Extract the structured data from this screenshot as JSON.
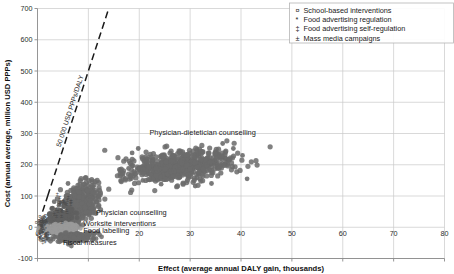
{
  "chart_data": {
    "type": "scatter",
    "title": "",
    "xlabel": "Effect (average annual DALY gain, thousands)",
    "ylabel": "Cost (annual average, million USD PPPs)",
    "xlim": [
      0,
      80
    ],
    "ylim": [
      -100,
      700
    ],
    "xticks": [
      0,
      10,
      20,
      30,
      40,
      50,
      60,
      70,
      80
    ],
    "yticks": [
      -100,
      0,
      100,
      200,
      300,
      400,
      500,
      600,
      700
    ],
    "xtick_labels": [
      "0",
      "10",
      "20",
      "30",
      "40",
      "50",
      "60",
      "70",
      "80"
    ],
    "ytick_labels": [
      "-100",
      "0",
      "100",
      "200",
      "300",
      "400",
      "500",
      "600",
      "700"
    ],
    "grid": true,
    "grid_color": "#c9c9c9",
    "marker_color": "#6b6b6b",
    "legend_position": "top-right",
    "threshold_line": {
      "label": "50 000 USD PPPs/DALY",
      "slope_usd_per_daly": 50000,
      "style": "dashed",
      "color": "#1a1a1a",
      "x_start": 2.0,
      "y_start": 100,
      "x_end": 14.0,
      "y_end": 700
    },
    "legend": [
      {
        "symbol": "¤",
        "label": "School-based interventions"
      },
      {
        "symbol": "*",
        "label": "Food advertising regulation"
      },
      {
        "symbol": "‡",
        "label": "Food advertising self-regulation"
      },
      {
        "symbol": "±",
        "label": "Mass media campaigns"
      }
    ],
    "annotations": [
      {
        "text": "Physician-dietetician counselling",
        "x": 22.0,
        "y": 295
      },
      {
        "text": "Physician counselling",
        "x": 11.5,
        "y": 40
      },
      {
        "text": "Worksite interventions",
        "x": 9.0,
        "y": 5
      },
      {
        "text": "Food labelling",
        "x": 9.0,
        "y": -18
      },
      {
        "text": "Fiscal measures",
        "x": 5.0,
        "y": -58
      }
    ],
    "clusters": [
      {
        "name": "Physician-dietetician counselling",
        "center_x": 28.0,
        "center_y": 195,
        "spread_x": 5.0,
        "spread_y": 30,
        "n": 620,
        "marker": "circle",
        "color": "#6b6b6b",
        "size": 2.6
      },
      {
        "name": "Physician counselling",
        "center_x": 8.3,
        "center_y": 75,
        "spread_x": 1.7,
        "spread_y": 38,
        "n": 420,
        "marker": "circle",
        "color": "#6b6b6b",
        "size": 2.6
      },
      {
        "name": "Worksite interventions",
        "center_x": 4.4,
        "center_y": 25,
        "spread_x": 1.4,
        "spread_y": 26,
        "n": 230,
        "marker": "circle",
        "color": "#5f5f5f",
        "size": 2.4
      },
      {
        "name": "Food labelling",
        "center_x": 4.6,
        "center_y": -3,
        "spread_x": 1.6,
        "spread_y": 8,
        "n": 180,
        "marker": "circle",
        "color": "#9a9a9a",
        "size": 2.3
      },
      {
        "name": "Fiscal measures",
        "center_x": 7.2,
        "center_y": -33,
        "spread_x": 2.0,
        "spread_y": 9,
        "n": 200,
        "marker": "circle",
        "color": "#6b6b6b",
        "size": 2.4
      },
      {
        "name": "School-based interventions",
        "center_x": 0.9,
        "center_y": 18,
        "spread_x": 0.5,
        "spread_y": 14,
        "n": 40,
        "marker": "text",
        "glyph": "¤",
        "color": "#4a4a4a",
        "size": 5.5
      },
      {
        "name": "Food advertising regulation",
        "center_x": 0.7,
        "center_y": -22,
        "spread_x": 0.45,
        "spread_y": 10,
        "n": 34,
        "marker": "text",
        "glyph": "*",
        "color": "#4a4a4a",
        "size": 5.5
      },
      {
        "name": "Food advertising self-regulation",
        "center_x": 1.3,
        "center_y": -30,
        "spread_x": 0.5,
        "spread_y": 8,
        "n": 30,
        "marker": "text",
        "glyph": "‡",
        "color": "#4a4a4a",
        "size": 5.5
      },
      {
        "name": "Mass media campaigns",
        "center_x": 5.2,
        "center_y": 68,
        "spread_x": 0.9,
        "spread_y": 22,
        "n": 26,
        "marker": "text",
        "glyph": "±",
        "color": "#4a4a4a",
        "size": 5.5
      }
    ],
    "outliers": [
      {
        "x": 41.2,
        "y": 155
      },
      {
        "x": 40.3,
        "y": 230
      },
      {
        "x": 38.5,
        "y": 252
      },
      {
        "x": 36.4,
        "y": 268
      },
      {
        "x": 19.8,
        "y": 252
      },
      {
        "x": 18.6,
        "y": 238
      },
      {
        "x": 17.9,
        "y": 188
      },
      {
        "x": 18.4,
        "y": 166
      },
      {
        "x": 20.7,
        "y": 150
      },
      {
        "x": 24.3,
        "y": 138
      },
      {
        "x": 31.0,
        "y": 132
      },
      {
        "x": 34.2,
        "y": 140
      },
      {
        "x": 10.4,
        "y": 128
      },
      {
        "x": 11.2,
        "y": 108
      },
      {
        "x": 6.0,
        "y": 140
      }
    ]
  }
}
